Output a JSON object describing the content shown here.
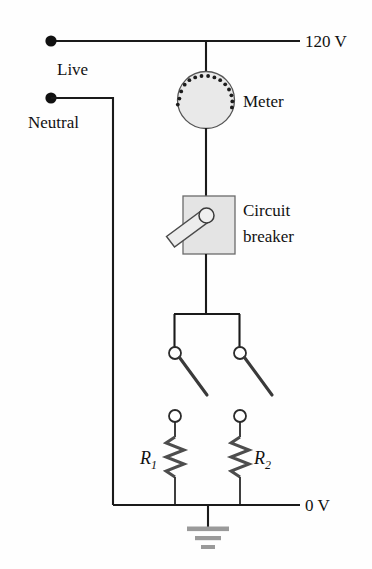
{
  "figure": {
    "background_color": "#fefefe"
  },
  "labels": {
    "supply_voltage": "120 V",
    "live": "Live",
    "neutral": "Neutral",
    "meter": "Meter",
    "circuit_breaker_line1": "Circuit",
    "circuit_breaker_line2": "breaker",
    "ground_voltage": "0 V",
    "resistor_1": "R",
    "resistor_1_sub": "1",
    "resistor_2": "R",
    "resistor_2_sub": "2"
  },
  "colors": {
    "wire": "#1a1a1a",
    "meter_fill": "#e9e9e9",
    "breaker_fill": "#e4e4e4",
    "ground_bar": "#9a9a9a",
    "text": "#111111",
    "background": "#fefefe"
  },
  "components": {
    "meter": {
      "name": "electric meter",
      "shape": "circle",
      "tick_count": 15
    },
    "circuit_breaker": {
      "name": "circuit breaker",
      "shape": "square with lever switch"
    },
    "switches": [
      {
        "name": "switch-left",
        "state": "open"
      },
      {
        "name": "switch-right",
        "state": "open"
      }
    ],
    "resistors": [
      {
        "name": "resistor-1",
        "label": "R1"
      },
      {
        "name": "resistor-2",
        "label": "R2"
      }
    ],
    "ground": {
      "name": "earth ground",
      "bars": 3
    }
  }
}
